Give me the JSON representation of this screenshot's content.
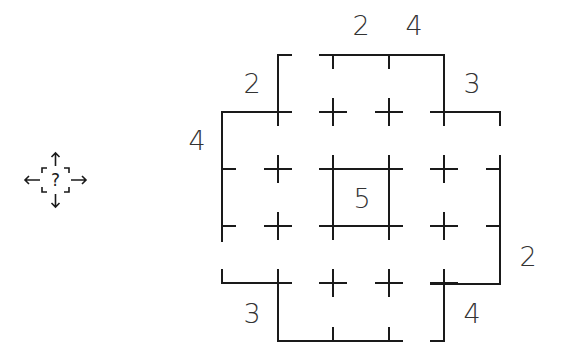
{
  "puzzle": {
    "type": "skyscraper-style grid puzzle",
    "grid_size": "5x5 (cross-shaped region)",
    "center_clue": "5",
    "clues": {
      "top": [
        {
          "label": "2",
          "position": "above column 3"
        },
        {
          "label": "4",
          "position": "above column 4"
        }
      ],
      "top_left_diagonal": {
        "label": "2"
      },
      "top_right_diagonal": {
        "label": "3"
      },
      "left": {
        "label": "4",
        "position": "left of row 2"
      },
      "right": {
        "label": "2",
        "position": "right of row 4"
      },
      "bottom_left_diagonal": {
        "label": "3"
      },
      "bottom_right_diagonal": {
        "label": "4"
      }
    }
  },
  "toolbar": {
    "hint_icon": "move-hint-icon",
    "hint_glyph": "?"
  },
  "colors": {
    "line": "#1a1a1a",
    "clue_text": "#333333",
    "background": "#ffffff"
  }
}
